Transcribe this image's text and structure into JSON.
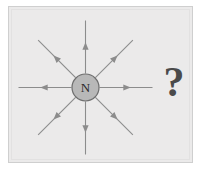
{
  "figure": {
    "panel_background": "#ebeaea",
    "panel_border_color": "#cfcfcf",
    "page_background": "#ffffff"
  },
  "pole": {
    "label": "N",
    "fill_color": "#b8b8b8",
    "stroke_color": "#6e6e6e",
    "center_x": 85.5,
    "center_y": 87.5,
    "radius": 13.5
  },
  "field_lines": {
    "count": 8,
    "color": "#8c8c8c",
    "stroke_width": 1.1,
    "arrow_direction": "outward",
    "inner_radius": 14,
    "outer_radius": 67,
    "arrow_at_fraction": 0.52,
    "angles_deg": [
      0,
      45,
      90,
      135,
      180,
      225,
      270,
      315
    ]
  },
  "annotation": {
    "question_mark": "?",
    "color": "#4a4a4a"
  },
  "chart_data": {
    "type": "scatter",
    "xlabel": "",
    "ylabel": "",
    "categories": [
      "up",
      "up-right",
      "right",
      "down-right",
      "down",
      "down-left",
      "left",
      "up-left"
    ],
    "values": [
      1,
      1,
      1,
      1,
      1,
      1,
      1,
      1
    ],
    "annotations": [
      "N",
      "?"
    ],
    "legend": []
  }
}
